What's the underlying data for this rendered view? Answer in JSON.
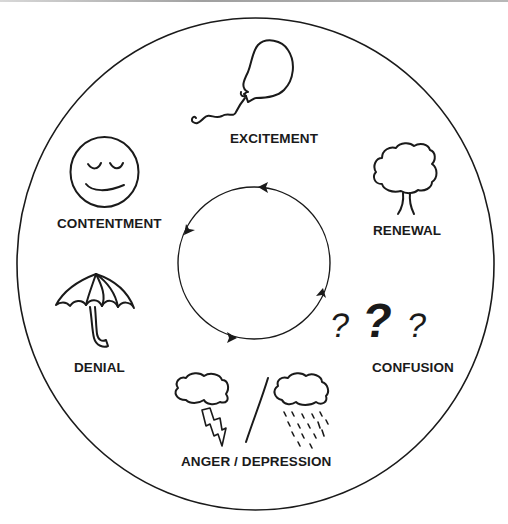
{
  "diagram": {
    "type": "emotional-cycle",
    "colors": {
      "stroke": "#1a1a1a",
      "background": "#ffffff",
      "text": "#1a1a1a"
    },
    "cycle": {
      "direction": "counter-clockwise",
      "arrow_count": 4
    },
    "stages": [
      {
        "label": "EXCITEMENT",
        "icon": "balloon-icon"
      },
      {
        "label": "RENEWAL",
        "icon": "tree-icon"
      },
      {
        "label": "CONFUSION",
        "icon": "question-marks-icon"
      },
      {
        "label": "ANGER / DEPRESSION",
        "icon": "storm-cloud-and-rain-cloud-icon"
      },
      {
        "label": "DENIAL",
        "icon": "umbrella-icon"
      },
      {
        "label": "CONTENTMENT",
        "icon": "smiley-face-icon"
      }
    ]
  }
}
